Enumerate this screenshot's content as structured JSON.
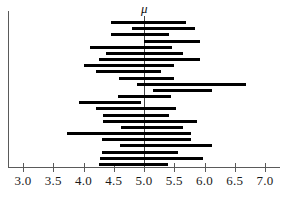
{
  "chart_data": {
    "type": "bar",
    "title": "",
    "subtitle": "",
    "xlabel": "",
    "ylabel": "",
    "orientation": "horizontal",
    "grid": false,
    "legend": false,
    "xlim": [
      2.8,
      7.2
    ],
    "xticks": [
      3.0,
      3.5,
      4.0,
      4.5,
      5.0,
      5.5,
      6.0,
      6.5,
      7.0
    ],
    "xtick_labels": [
      "3.0",
      "3.5",
      "4.0",
      "4.5",
      "5.0",
      "5.5",
      "6.0",
      "6.5",
      "7.0"
    ],
    "reference_line": {
      "label": "μ",
      "value": 5.0
    },
    "intervals": [
      {
        "index": 1,
        "lower": 4.45,
        "upper": 5.7,
        "contains_mu": true
      },
      {
        "index": 2,
        "lower": 4.8,
        "upper": 5.85,
        "contains_mu": true
      },
      {
        "index": 3,
        "lower": 4.45,
        "upper": 5.42,
        "contains_mu": true
      },
      {
        "index": 4,
        "lower": 5.0,
        "upper": 5.93,
        "contains_mu": true
      },
      {
        "index": 5,
        "lower": 4.1,
        "upper": 5.47,
        "contains_mu": true
      },
      {
        "index": 6,
        "lower": 4.37,
        "upper": 5.65,
        "contains_mu": true
      },
      {
        "index": 7,
        "lower": 4.25,
        "upper": 5.92,
        "contains_mu": true
      },
      {
        "index": 8,
        "lower": 4.0,
        "upper": 5.5,
        "contains_mu": true
      },
      {
        "index": 9,
        "lower": 4.2,
        "upper": 5.28,
        "contains_mu": true
      },
      {
        "index": 10,
        "lower": 4.58,
        "upper": 5.5,
        "contains_mu": true
      },
      {
        "index": 11,
        "lower": 4.88,
        "upper": 6.68,
        "contains_mu": true
      },
      {
        "index": 12,
        "lower": 5.15,
        "upper": 6.12,
        "contains_mu": false
      },
      {
        "index": 13,
        "lower": 4.57,
        "upper": 5.45,
        "contains_mu": true
      },
      {
        "index": 14,
        "lower": 3.92,
        "upper": 4.95,
        "contains_mu": false
      },
      {
        "index": 15,
        "lower": 4.2,
        "upper": 5.53,
        "contains_mu": true
      },
      {
        "index": 16,
        "lower": 4.32,
        "upper": 5.42,
        "contains_mu": true
      },
      {
        "index": 17,
        "lower": 4.33,
        "upper": 5.88,
        "contains_mu": true
      },
      {
        "index": 18,
        "lower": 4.62,
        "upper": 5.65,
        "contains_mu": true
      },
      {
        "index": 19,
        "lower": 3.72,
        "upper": 5.78,
        "contains_mu": true
      },
      {
        "index": 20,
        "lower": 4.3,
        "upper": 5.78,
        "contains_mu": true
      },
      {
        "index": 21,
        "lower": 4.6,
        "upper": 6.12,
        "contains_mu": true
      },
      {
        "index": 22,
        "lower": 4.3,
        "upper": 5.57,
        "contains_mu": true
      },
      {
        "index": 23,
        "lower": 4.28,
        "upper": 5.98,
        "contains_mu": true
      },
      {
        "index": 24,
        "lower": 4.25,
        "upper": 5.4,
        "contains_mu": true
      }
    ]
  },
  "figure": {
    "mu_symbol": "μ"
  }
}
